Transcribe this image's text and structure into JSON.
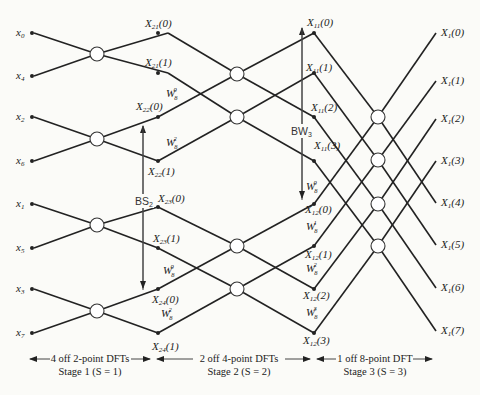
{
  "inputs": [
    {
      "label": "x0",
      "sub": "0",
      "y": 33
    },
    {
      "label": "x4",
      "sub": "4",
      "y": 76
    },
    {
      "label": "x2",
      "sub": "2",
      "y": 117
    },
    {
      "label": "x6",
      "sub": "6",
      "y": 161
    },
    {
      "label": "x1",
      "sub": "1",
      "y": 204
    },
    {
      "label": "x5",
      "sub": "5",
      "y": 248
    },
    {
      "label": "x3",
      "sub": "3",
      "y": 289
    },
    {
      "label": "x7",
      "sub": "7",
      "y": 333
    }
  ],
  "stage1_outputs": [
    "X21(0)",
    "X21(1)",
    "X22(0)",
    "X22(1)",
    "X23(0)",
    "X23(1)",
    "X24(0)",
    "X24(1)"
  ],
  "stage2_outputs": [
    "X11(0)",
    "X11(1)",
    "X11(2)",
    "X11(3)",
    "X12(0)",
    "X12(1)",
    "X12(2)",
    "X12(3)"
  ],
  "outputs": [
    "X1(0)",
    "X1(1)",
    "X1(2)",
    "X1(3)",
    "X1(4)",
    "X1(5)",
    "X1(6)",
    "X1(7)"
  ],
  "twiddles_stage2": [
    "W8^0",
    "W8^2",
    "W8^0",
    "W8^2"
  ],
  "twiddles_stage3": [
    "W8^0",
    "W8^1",
    "W8^2",
    "W8^3"
  ],
  "annotations": {
    "bs2": "BS2",
    "bw3": "BW3"
  },
  "stages": [
    {
      "title": "4 off 2-point DFTs",
      "subtitle": "Stage 1 (S = 1)"
    },
    {
      "title": "2 off 4-point DFTs",
      "subtitle": "Stage 2 (S = 2)"
    },
    {
      "title": "1 off 8-point DFT",
      "subtitle": "Stage 3 (S = 3)"
    }
  ]
}
